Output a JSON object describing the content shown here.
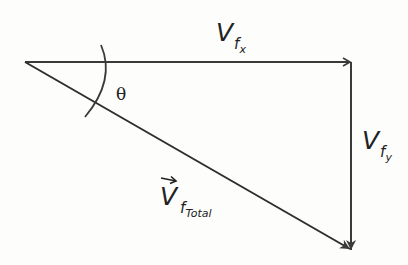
{
  "diagram": {
    "type": "vector-triangle",
    "colors": {
      "line": "#3a3a3a",
      "text": "#222222",
      "background": "#fdfdfc"
    },
    "angle_label": "θ",
    "labels": {
      "horizontal": {
        "main": "V",
        "sub": "f",
        "subsub": "x"
      },
      "vertical": {
        "main": "V",
        "sub": "f",
        "subsub": "y"
      },
      "hypotenuse": {
        "main": "V",
        "sub": "f",
        "subsub": "Total",
        "has_vector_arrow": true
      }
    },
    "vectors": [
      {
        "name": "horizontal-component",
        "from": [
          25,
          62
        ],
        "to": [
          351,
          62
        ]
      },
      {
        "name": "vertical-component",
        "from": [
          351,
          62
        ],
        "to": [
          351,
          250
        ]
      },
      {
        "name": "total-vector",
        "from": [
          25,
          62
        ],
        "to": [
          351,
          250
        ]
      }
    ]
  }
}
